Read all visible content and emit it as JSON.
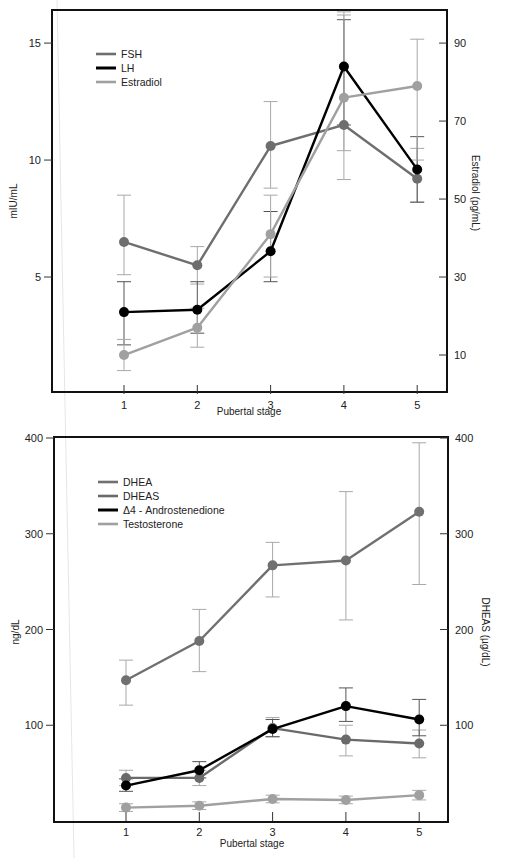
{
  "chart_data": [
    {
      "type": "line",
      "title": "",
      "xlabel": "Pubertal stage",
      "ylabel": "mIU/mL",
      "ylabel_right": "Estradiol (pg/mL)",
      "x": [
        1,
        2,
        3,
        4,
        5
      ],
      "x_tick_labels": [
        "1",
        "2",
        "3",
        "4",
        "5"
      ],
      "y_ticks": [
        5,
        10,
        15
      ],
      "y_tick_labels": [
        "5",
        "10",
        "15"
      ],
      "y_right_ticks": [
        10,
        30,
        50,
        70,
        90
      ],
      "y_right_tick_labels": [
        "10",
        "30",
        "50",
        "70",
        "90"
      ],
      "ylim": [
        0,
        16.5
      ],
      "ylim_right": [
        0,
        99
      ],
      "grid": false,
      "legend_position": "upper left",
      "series": [
        {
          "name": "FSH",
          "axis": "left",
          "color": "#6e6e6e",
          "values": [
            6.5,
            5.5,
            10.6,
            11.5,
            9.2
          ],
          "err_low": [
            5.1,
            4.7,
            8.8,
            10.4,
            8.2
          ],
          "err_high": [
            8.5,
            6.3,
            12.5,
            16.2,
            10.5
          ]
        },
        {
          "name": "LH",
          "axis": "left",
          "color": "#000000",
          "values": [
            3.5,
            3.6,
            6.1,
            14.0,
            9.6
          ],
          "err_low": [
            2.1,
            2.6,
            4.8,
            11.5,
            8.2
          ],
          "err_high": [
            4.8,
            4.8,
            7.8,
            16.0,
            11.0
          ]
        },
        {
          "name": "Estradiol",
          "axis": "right",
          "color": "#a0a0a0",
          "values": [
            10,
            17,
            41,
            76,
            79
          ],
          "err_low": [
            6,
            12,
            30,
            55,
            60
          ],
          "err_high": [
            14,
            22,
            51,
            98,
            91
          ]
        }
      ]
    },
    {
      "type": "line",
      "title": "",
      "xlabel": "Pubertal stage",
      "ylabel": "ng/dL",
      "ylabel_right": "DHEAS (µg/dL)",
      "x": [
        1,
        2,
        3,
        4,
        5
      ],
      "x_tick_labels": [
        "1",
        "2",
        "3",
        "4",
        "5"
      ],
      "y_ticks": [
        100,
        200,
        300,
        400
      ],
      "y_tick_labels": [
        "100",
        "200",
        "300",
        "400"
      ],
      "y_right_ticks": [
        100,
        200,
        300,
        400
      ],
      "y_right_tick_labels": [
        "100",
        "200",
        "300",
        "400"
      ],
      "ylim": [
        0,
        400
      ],
      "ylim_right": [
        0,
        400
      ],
      "grid": false,
      "legend_position": "upper left",
      "series": [
        {
          "name": "DHEA",
          "axis": "left",
          "color": "#707070",
          "values": [
            147,
            188,
            267,
            272,
            323
          ],
          "err_low": [
            121,
            156,
            234,
            210,
            247
          ],
          "err_high": [
            168,
            221,
            291,
            344,
            395
          ]
        },
        {
          "name": "DHEAS",
          "axis": "right",
          "color": "#6a6a6a",
          "values": [
            45,
            45,
            97,
            85,
            81
          ],
          "err_low": [
            37,
            37,
            88,
            68,
            66
          ],
          "err_high": [
            53,
            53,
            108,
            100,
            95
          ]
        },
        {
          "name": "Δ4 - Androstenedione",
          "axis": "left",
          "color": "#000000",
          "values": [
            37,
            53,
            96,
            120,
            106
          ],
          "err_low": [
            31,
            45,
            88,
            104,
            89
          ],
          "err_high": [
            44,
            62,
            106,
            139,
            127
          ]
        },
        {
          "name": "Testosterone",
          "axis": "left",
          "color": "#a0a0a0",
          "values": [
            14,
            16,
            23,
            22,
            27
          ],
          "err_low": [
            10,
            12,
            19,
            18,
            22
          ],
          "err_high": [
            18,
            20,
            27,
            26,
            32
          ]
        }
      ]
    }
  ],
  "top_chart": {
    "xlabel": "Pubertal stage",
    "ylabel": "mIU/mL",
    "ylabel_right": "Estradiol (pg/mL)",
    "legend": [
      "FSH",
      "LH",
      "Estradiol"
    ]
  },
  "bottom_chart": {
    "xlabel": "Pubertal stage",
    "ylabel": "ng/dL",
    "ylabel_right": "DHEAS (µg/dL)",
    "legend": [
      "DHEA",
      "DHEAS",
      "Δ4 - Androstenedione",
      "Testosterone"
    ]
  }
}
